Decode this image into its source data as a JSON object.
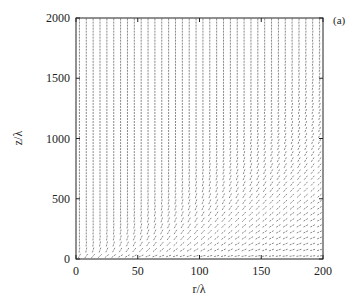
{
  "chart_data": {
    "type": "vector-field",
    "title": "",
    "panel_label": "(a)",
    "xlabel": "r/λ",
    "ylabel": "z/λ",
    "xlim": [
      0,
      200
    ],
    "ylim": [
      0,
      2000
    ],
    "xticks": [
      0,
      50,
      100,
      150,
      200
    ],
    "yticks": [
      0,
      500,
      1000,
      1500,
      2000
    ],
    "xtick_labels": [
      "0",
      "50",
      "100",
      "150",
      "200"
    ],
    "ytick_labels": [
      "0",
      "500",
      "1000",
      "1500",
      "2000"
    ],
    "grid": false,
    "legend": null,
    "field_description": "Direction field of short arrows on a regular grid (~36 columns x ~40 rows). Arrows are vertical at large z; near z≈0 they are horizontal; in the lower region (z < ~600) arrows tilt diagonally, with the tilt increasing with r, forming curved field lines that bend from horizontal near the bottom to vertical above.",
    "grid_columns": 36,
    "grid_rows": 40,
    "arrow_color": "#555555"
  },
  "colors": {
    "frame": "#222222",
    "arrows": "#555555",
    "background": "#ffffff"
  }
}
